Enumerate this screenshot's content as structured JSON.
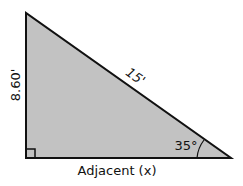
{
  "diagram": {
    "type": "right-triangle",
    "fill_color": "#c2c2c2",
    "stroke_color": "#111111",
    "vertices": {
      "top": [
        26,
        13
      ],
      "right_angle": [
        26,
        158
      ],
      "acute": [
        231,
        158
      ]
    },
    "labels": {
      "opposite": "8.60'",
      "hypotenuse": "15'",
      "adjacent": "Adjacent (x)",
      "angle": "35°"
    }
  }
}
